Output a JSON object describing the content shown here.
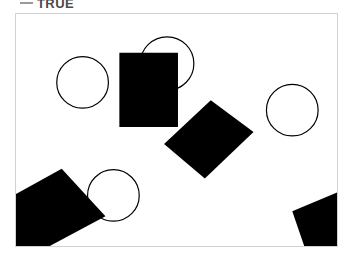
{
  "header": {
    "legend_marker": "line-dash-marker",
    "label": "TRUE"
  },
  "canvas": {
    "name": "shapes-canvas",
    "width": 323,
    "height": 234,
    "background_color": "#ffffff",
    "border_color": "#d2d2d2"
  },
  "palette": {
    "fill": "#000000",
    "stroke": "#000000",
    "background": "#ffffff",
    "frame": "#d2d2d2",
    "legend": "#9a9a9a"
  },
  "shapes": [
    {
      "id": "circle-top-left",
      "type": "circle",
      "cx": 67,
      "cy": 69,
      "r": 26,
      "filled": false
    },
    {
      "id": "circle-top-center",
      "type": "circle",
      "cx": 152,
      "cy": 50,
      "r": 27,
      "filled": false
    },
    {
      "id": "circle-right",
      "type": "circle",
      "cx": 278,
      "cy": 97,
      "r": 26,
      "filled": false
    },
    {
      "id": "circle-bottom-left",
      "type": "circle",
      "cx": 98,
      "cy": 183,
      "r": 26,
      "filled": false
    },
    {
      "id": "square-upper-center",
      "type": "square",
      "points": "104,39 163,39 163,114 104,114",
      "rotation": 0,
      "filled": true
    },
    {
      "id": "square-rotated-center",
      "type": "square",
      "points": "149,131 196,87 239,119 190,166",
      "rotation": -25,
      "filled": true
    },
    {
      "id": "square-bottom-left",
      "type": "square",
      "points": "-6,185 46,156 90,204 34,234 -6,234",
      "rotation": 20,
      "filled": true
    },
    {
      "id": "square-bottom-right",
      "type": "square",
      "points": "278,199 323,180 323,234 290,234",
      "rotation": 40,
      "filled": true
    }
  ]
}
